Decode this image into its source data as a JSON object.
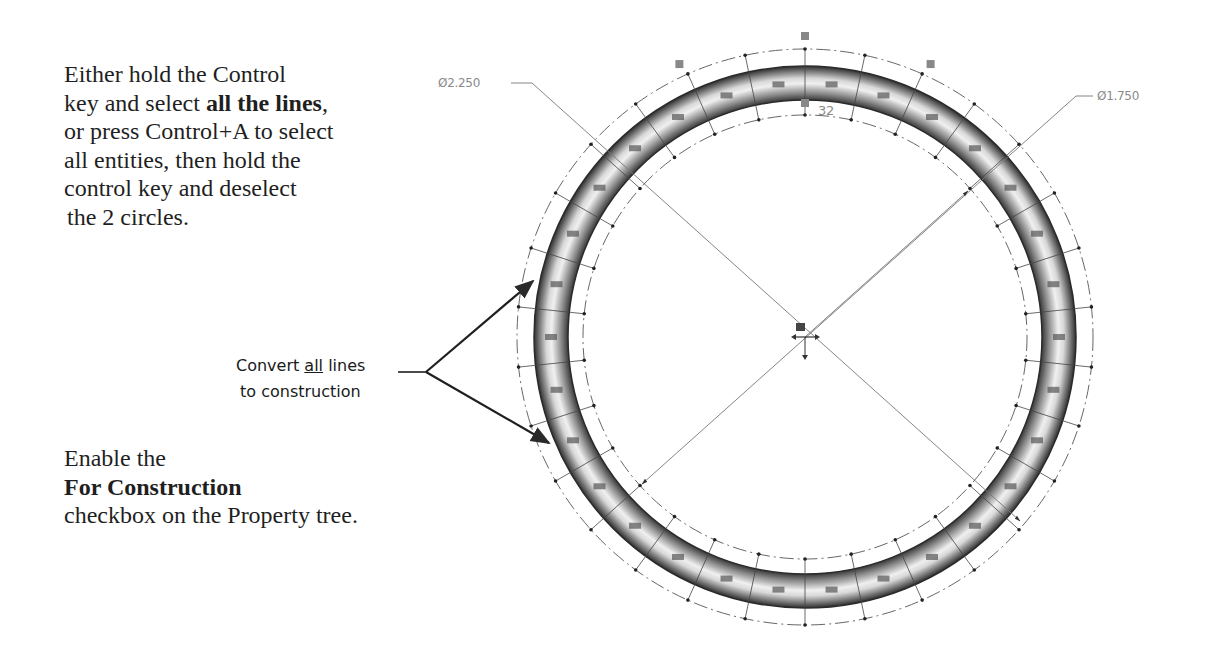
{
  "instructions": {
    "top": {
      "line1": "Either hold the Control",
      "line2_pre": "key and select ",
      "line2_bold": "all the lines",
      "line2_post": ",",
      "line3": "or press Control+A to select",
      "line4": "all entities, then hold the",
      "line5": "control key and deselect",
      "line6": "the 2 circles."
    },
    "bottom": {
      "line1": "Enable the",
      "line2_bold": "For Construction",
      "line3": "checkbox on the Property tree."
    }
  },
  "callout": {
    "pre": "Convert ",
    "underlined": "all",
    "post": " lines",
    "line2": "to construction"
  },
  "drawing": {
    "dimension_outer": "Ø2.250",
    "dimension_inner": "Ø1.750",
    "sketch_label": "32",
    "colors": {
      "ring_dark": "#3a3a3a",
      "ring_light": "#e8e8e8",
      "construction": "#555555",
      "dimension": "#8a8a8a",
      "arrow": "#2a2a2a"
    }
  }
}
